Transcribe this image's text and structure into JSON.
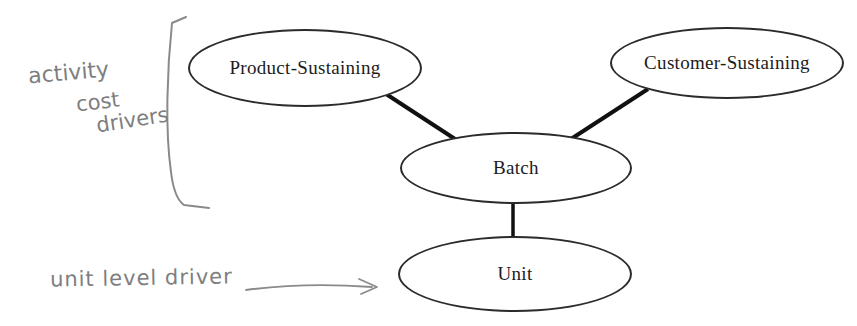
{
  "diagram": {
    "nodes": [
      {
        "id": "product-sustaining",
        "label": "Product-Sustaining"
      },
      {
        "id": "customer-sustaining",
        "label": "Customer-Sustaining"
      },
      {
        "id": "batch",
        "label": "Batch"
      },
      {
        "id": "unit",
        "label": "Unit"
      }
    ],
    "edges": [
      {
        "from": "product-sustaining",
        "to": "batch"
      },
      {
        "from": "customer-sustaining",
        "to": "batch"
      },
      {
        "from": "batch",
        "to": "unit"
      }
    ],
    "annotations": {
      "bracket_label_lines": [
        "activity",
        "cost",
        "drivers"
      ],
      "arrow_label": "unit level driver"
    },
    "colors": {
      "background": "#ffffff",
      "node_stroke": "#2b2b2b",
      "node_text": "#1c1c1c",
      "edge": "#111111",
      "handwriting": "#7e7e7e"
    }
  }
}
